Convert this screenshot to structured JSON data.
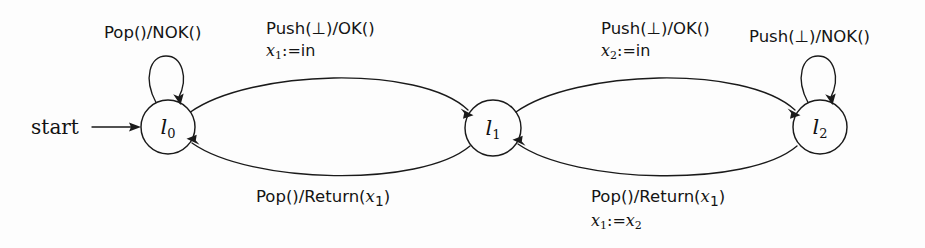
{
  "figure": {
    "kind": "register-automaton-state-diagram",
    "background_color": "#fdfdfd",
    "stroke_color": "#1a1a1a"
  },
  "start": {
    "label": "start",
    "arrow_icon": "arrow-right-icon"
  },
  "states": [
    {
      "id": "l0",
      "name": "l",
      "index": "0",
      "cx": 168,
      "cy": 127,
      "r": 27
    },
    {
      "id": "l1",
      "name": "l",
      "index": "1",
      "cx": 493,
      "cy": 128,
      "r": 28
    },
    {
      "id": "l2",
      "name": "l",
      "index": "2",
      "cx": 820,
      "cy": 127,
      "r": 27
    }
  ],
  "transitions": [
    {
      "id": "t0",
      "from": "l0",
      "to": "l0",
      "kind": "self-loop",
      "guard": "Pop()/NOK()",
      "assignment": null,
      "label_x": 175,
      "label_y": 28
    },
    {
      "id": "t1",
      "from": "l0",
      "to": "l1",
      "kind": "arc-top",
      "guard": "Push(⊥)/OK()",
      "assignment_var": "x",
      "assignment_sub": "1",
      "assignment_rhs": ":=in",
      "label_x": 265,
      "label_y": 22
    },
    {
      "id": "t2",
      "from": "l1",
      "to": "l0",
      "kind": "arc-bottom",
      "guard_pre": "Pop()/Return(",
      "guard_var": "x",
      "guard_sub": "1",
      "guard_post": ")",
      "assignment": null,
      "label_x": 255,
      "label_y": 189
    },
    {
      "id": "t3",
      "from": "l1",
      "to": "l2",
      "kind": "arc-top",
      "guard": "Push(⊥)/OK()",
      "assignment_var": "x",
      "assignment_sub": "2",
      "assignment_rhs": ":=in",
      "label_x": 600,
      "label_y": 22
    },
    {
      "id": "t4",
      "from": "l2",
      "to": "l1",
      "kind": "arc-bottom",
      "guard_pre": "Pop()/Return(",
      "guard_var": "x",
      "guard_sub": "1",
      "guard_post": ")",
      "assignment_var": "x",
      "assignment_sub": "1",
      "assignment_rhs2_var": "x",
      "assignment_rhs2_sub": "2",
      "label_x": 590,
      "label_y": 189
    },
    {
      "id": "t5",
      "from": "l2",
      "to": "l2",
      "kind": "self-loop",
      "guard": "Push(⊥)/NOK()",
      "assignment": null,
      "label_x": 748,
      "label_y": 30
    }
  ],
  "labels": {
    "pop_nok": "Pop()/NOK()",
    "push_ok": "Push(⊥)/OK()",
    "push_nok": "Push(⊥)/NOK()",
    "return_pre": "Pop()/Return(",
    "return_post": ")",
    "assign_op": ":=",
    "in_keyword": "in",
    "var_x": "x",
    "sub_1": "1",
    "sub_2": "2",
    "state_letter": "l",
    "state_0": "0",
    "state_1": "1",
    "state_2": "2"
  }
}
